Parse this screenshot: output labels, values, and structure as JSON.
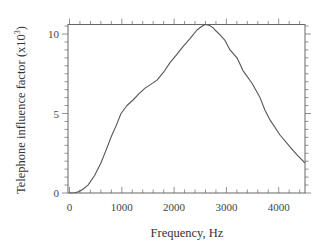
{
  "chart_data": {
    "type": "line",
    "title": "",
    "xlabel": "Frequency, Hz",
    "ylabel": "Telephone influence factor (x10",
    "ylabel_superscript": "3",
    "ylabel_suffix": ")",
    "xlim": [
      0,
      4500
    ],
    "ylim": [
      0,
      10.8
    ],
    "x_ticks": [
      0,
      1000,
      2000,
      3000,
      4000
    ],
    "x_tick_labels": [
      "0",
      "1000",
      "2000",
      "3000",
      "4000"
    ],
    "y_ticks": [
      0,
      5,
      10
    ],
    "y_tick_labels": [
      "0",
      "5",
      "10"
    ],
    "x_minor_step": 200,
    "y_minor_step": 0.5,
    "grid": false,
    "legend": null,
    "series": [
      {
        "name": "Telephone influence factor",
        "color": "#555555",
        "x": [
          0,
          100,
          170,
          250,
          354,
          480,
          602,
          700,
          794,
          900,
          985,
          1100,
          1214,
          1330,
          1444,
          1560,
          1673,
          1800,
          1922,
          2050,
          2170,
          2300,
          2438,
          2520,
          2591,
          2670,
          2744,
          2782,
          2880,
          2973,
          3069,
          3203,
          3317,
          3489,
          3642,
          3738,
          3834,
          4025,
          4216,
          4350,
          4484,
          4500
        ],
        "y": [
          0,
          0.02,
          0.08,
          0.22,
          0.5,
          1.1,
          1.9,
          2.7,
          3.5,
          4.3,
          5.0,
          5.5,
          5.85,
          6.25,
          6.6,
          6.85,
          7.1,
          7.6,
          8.2,
          8.7,
          9.2,
          9.7,
          10.25,
          10.45,
          10.6,
          10.55,
          10.4,
          10.25,
          9.95,
          9.6,
          9.0,
          8.5,
          7.7,
          6.9,
          6.0,
          5.2,
          4.6,
          3.65,
          2.9,
          2.4,
          1.95,
          1.9
        ]
      }
    ]
  }
}
